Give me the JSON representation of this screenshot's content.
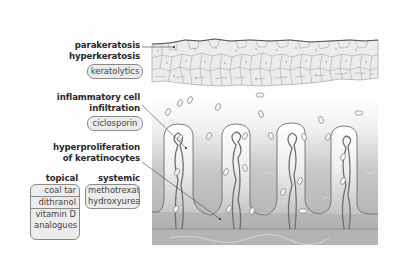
{
  "figure": {
    "labels": {
      "parakeratosis": "parakeratosis",
      "hyperkeratosis": "hyperkeratosis",
      "inflammatory_line1": "inflammatory cell",
      "inflammatory_line2": "infiltration",
      "hyperproliferation_line1": "hyperproliferation",
      "hyperproliferation_line2": "of keratinocytes"
    },
    "treatments": {
      "keratolytics": "keratolytics",
      "ciclosporin": "ciclosporin",
      "topical": {
        "heading": "topical",
        "items": [
          "coal tar",
          "dithranol",
          "vitamin D",
          "analogues"
        ]
      },
      "systemic": {
        "heading": "systemic",
        "items": [
          "methotrexate",
          "hydroxyurea"
        ]
      }
    },
    "colors": {
      "epidermis_fill": "#ececec",
      "cell_outline": "#8c8c8c",
      "dermis_light": "#f2f2f2",
      "dermis_dark": "#b4b4b4",
      "vessel": "#7a7a7a",
      "pill_fill": "#ececec"
    }
  }
}
